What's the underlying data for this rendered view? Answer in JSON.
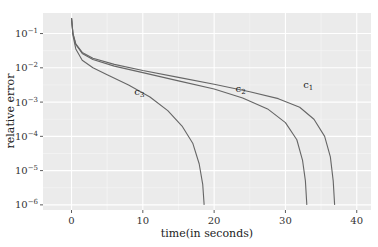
{
  "chart_data": {
    "type": "line",
    "title": "",
    "xlabel": "time(in seconds)",
    "ylabel": "relative error",
    "xlim": [
      -4,
      42
    ],
    "ylim_log10": [
      -6.15,
      -0.4
    ],
    "y_scale": "log",
    "grid": true,
    "legend": "none",
    "x_ticks": [
      0,
      10,
      20,
      30,
      40
    ],
    "x_tick_labels": [
      "0",
      "10",
      "20",
      "30",
      "40"
    ],
    "y_ticks_log10": [
      -1,
      -2,
      -3,
      -4,
      -5,
      -6
    ],
    "y_tick_labels": [
      {
        "base": "10",
        "exp": "−1"
      },
      {
        "base": "10",
        "exp": "−2"
      },
      {
        "base": "10",
        "exp": "−3"
      },
      {
        "base": "10",
        "exp": "−4"
      },
      {
        "base": "10",
        "exp": "−5"
      },
      {
        "base": "10",
        "exp": "−6"
      }
    ],
    "series": [
      {
        "name": "c1",
        "label": "c",
        "label_sub": "1",
        "label_at": [
          32.5,
          -2.6
        ],
        "points": [
          [
            0.0,
            -0.55
          ],
          [
            0.2,
            -1.0
          ],
          [
            0.6,
            -1.3
          ],
          [
            1.5,
            -1.55
          ],
          [
            3,
            -1.72
          ],
          [
            6,
            -1.9
          ],
          [
            10,
            -2.08
          ],
          [
            15,
            -2.28
          ],
          [
            20,
            -2.48
          ],
          [
            25,
            -2.7
          ],
          [
            29,
            -2.9
          ],
          [
            32,
            -3.15
          ],
          [
            34,
            -3.5
          ],
          [
            35.5,
            -4.0
          ],
          [
            36.3,
            -4.6
          ],
          [
            36.7,
            -5.3
          ],
          [
            36.9,
            -6.0
          ]
        ]
      },
      {
        "name": "c2",
        "label": "c",
        "label_sub": "2",
        "label_at": [
          23.0,
          -2.72
        ],
        "points": [
          [
            0.0,
            -0.55
          ],
          [
            0.2,
            -1.0
          ],
          [
            0.6,
            -1.32
          ],
          [
            1.5,
            -1.58
          ],
          [
            3,
            -1.76
          ],
          [
            6,
            -1.95
          ],
          [
            10,
            -2.14
          ],
          [
            15,
            -2.38
          ],
          [
            20,
            -2.62
          ],
          [
            24,
            -2.88
          ],
          [
            27.5,
            -3.2
          ],
          [
            30,
            -3.6
          ],
          [
            31.6,
            -4.1
          ],
          [
            32.4,
            -4.7
          ],
          [
            32.8,
            -5.3
          ],
          [
            33.0,
            -6.0
          ]
        ]
      },
      {
        "name": "c3",
        "label": "c",
        "label_sub": "3",
        "label_at": [
          8.8,
          -2.8
        ],
        "points": [
          [
            0.0,
            -0.55
          ],
          [
            0.2,
            -1.05
          ],
          [
            0.6,
            -1.45
          ],
          [
            1.5,
            -1.78
          ],
          [
            3,
            -2.0
          ],
          [
            5,
            -2.2
          ],
          [
            8,
            -2.5
          ],
          [
            11,
            -2.85
          ],
          [
            13.5,
            -3.25
          ],
          [
            15.5,
            -3.7
          ],
          [
            17,
            -4.2
          ],
          [
            17.9,
            -4.8
          ],
          [
            18.4,
            -5.4
          ],
          [
            18.6,
            -6.0
          ]
        ]
      }
    ]
  }
}
